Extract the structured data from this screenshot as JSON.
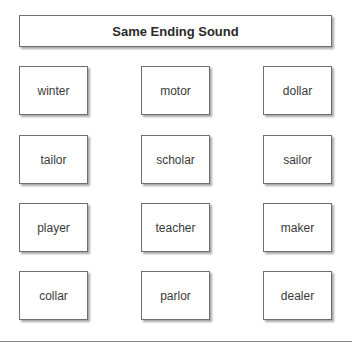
{
  "title": "Same Ending Sound",
  "words": [
    [
      "winter",
      "motor",
      "dollar"
    ],
    [
      "tailor",
      "scholar",
      "sailor"
    ],
    [
      "player",
      "teacher",
      "maker"
    ],
    [
      "collar",
      "parlor",
      "dealer"
    ]
  ]
}
